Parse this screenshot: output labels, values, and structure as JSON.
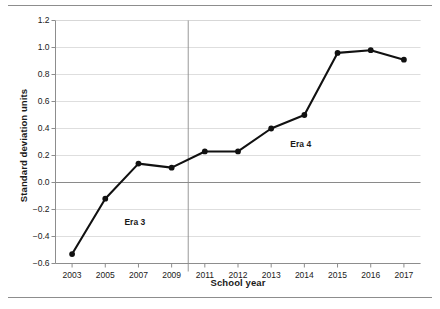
{
  "chart_data": {
    "type": "line",
    "title": "",
    "xlabel": "School year",
    "ylabel": "Standard deviation units",
    "categories": [
      "2003",
      "2005",
      "2007",
      "2009",
      "2011",
      "2012",
      "2013",
      "2014",
      "2015",
      "2016",
      "2017"
    ],
    "values": [
      -0.53,
      -0.12,
      0.14,
      0.11,
      0.23,
      0.23,
      0.4,
      0.5,
      0.96,
      0.98,
      0.91
    ],
    "series": [
      {
        "name": "Standard deviation units",
        "values": [
          -0.53,
          -0.12,
          0.14,
          0.11,
          0.23,
          0.23,
          0.4,
          0.5,
          0.96,
          0.98,
          0.91
        ]
      }
    ],
    "ylim": [
      -0.6,
      1.2
    ],
    "yticks": [
      "1.2",
      "1.0",
      "0.8",
      "0.6",
      "0.4",
      "0.2",
      "0.0",
      "-0.2",
      "-0.4",
      "-0.6"
    ],
    "ytick_values": [
      1.2,
      1.0,
      0.8,
      0.6,
      0.4,
      0.2,
      0.0,
      -0.2,
      -0.4,
      -0.6
    ],
    "xticks": [
      "2003",
      "2005",
      "2007",
      "2009",
      "2011",
      "2012",
      "2013",
      "2014",
      "2015",
      "2016",
      "2017"
    ],
    "grid": true,
    "legend": "none",
    "annotations": [
      {
        "text": "Era 3",
        "x_category": "2007",
        "y_value": -0.3
      },
      {
        "text": "Era 4",
        "x_category": "2014",
        "y_value": 0.28
      }
    ],
    "reference_lines": [
      {
        "orientation": "horizontal",
        "value": 0.0
      },
      {
        "orientation": "vertical",
        "between": [
          "2009",
          "2011"
        ],
        "label": "era-divider"
      }
    ],
    "colors": {
      "line": "#111111",
      "marker": "#111111",
      "grid": "#d6d6d6",
      "axis": "#8d8d8d",
      "zero_line": "#8a8a8a",
      "text": "#1a1a1a"
    }
  }
}
